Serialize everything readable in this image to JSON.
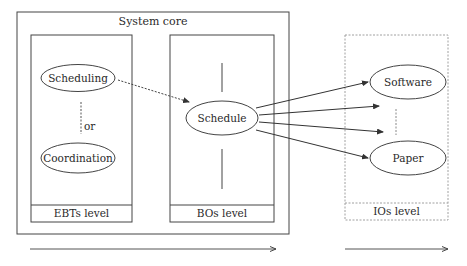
{
  "diagram": {
    "system_core": {
      "title": "System core"
    },
    "levels": [
      {
        "id": "ebts",
        "label": "EBTs level",
        "style": "solid"
      },
      {
        "id": "bos",
        "label": "BOs level",
        "style": "solid"
      },
      {
        "id": "ios",
        "label": "IOs level",
        "style": "dashed"
      }
    ],
    "nodes": {
      "scheduling": "Scheduling",
      "coordination": "Coordination",
      "schedule": "Schedule",
      "software": "Software",
      "paper": "Paper"
    },
    "connector_labels": {
      "or": "or"
    },
    "edges": [
      {
        "from": "Scheduling",
        "to": "Schedule",
        "style": "dashed"
      },
      {
        "from": "Schedule",
        "to": "Software",
        "style": "solid"
      },
      {
        "from": "Schedule",
        "to": "(unnamed IO)",
        "style": "solid"
      },
      {
        "from": "Schedule",
        "to": "(unnamed IO)",
        "style": "solid"
      },
      {
        "from": "Schedule",
        "to": "Paper",
        "style": "solid"
      }
    ],
    "colors": {
      "stroke": "#3a3a3a",
      "dashed_stroke": "#9a9a9a",
      "text": "#2a2a2a",
      "background": "#ffffff"
    }
  }
}
